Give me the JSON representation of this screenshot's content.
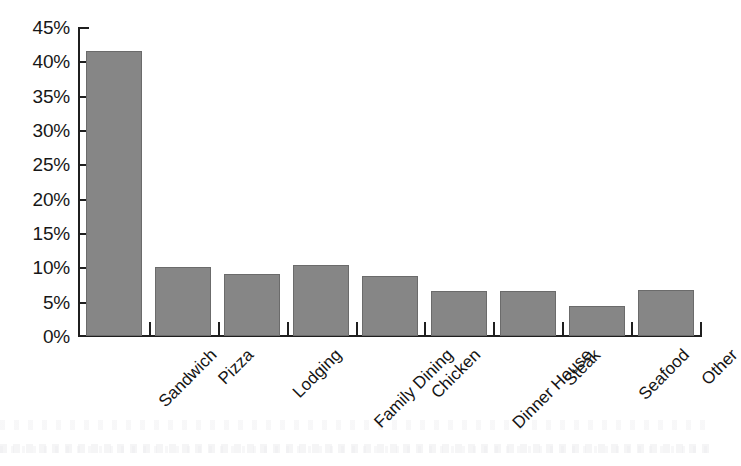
{
  "chart_data": {
    "type": "bar",
    "title": "",
    "subtitle": "",
    "xlabel": "",
    "ylabel": "",
    "categories": [
      "Sandwich",
      "Pizza",
      "Lodging",
      "Family Dining",
      "Chicken",
      "Dinner House",
      "Steak",
      "Seafood",
      "Other"
    ],
    "values": [
      41.5,
      10.1,
      9.0,
      10.3,
      8.7,
      6.6,
      6.6,
      4.3,
      6.7
    ],
    "value_suffix": "%",
    "ylim": [
      0,
      45
    ],
    "ytick_step": 5,
    "ytick_labels": [
      "45%",
      "40%",
      "35%",
      "30%",
      "25%",
      "20%",
      "15%",
      "10%",
      "5%",
      "0%"
    ],
    "ytick_values": [
      45,
      40,
      35,
      30,
      25,
      20,
      15,
      10,
      5,
      0
    ],
    "grid": false,
    "legend": false,
    "legend_position": "none",
    "x_label_rotation_deg": -45,
    "bar_color": "#868686",
    "bar_border_color": "#6b6b6b",
    "axis_color": "#1f1f1f",
    "text_color": "#171717",
    "background_color": "#ffffff"
  }
}
